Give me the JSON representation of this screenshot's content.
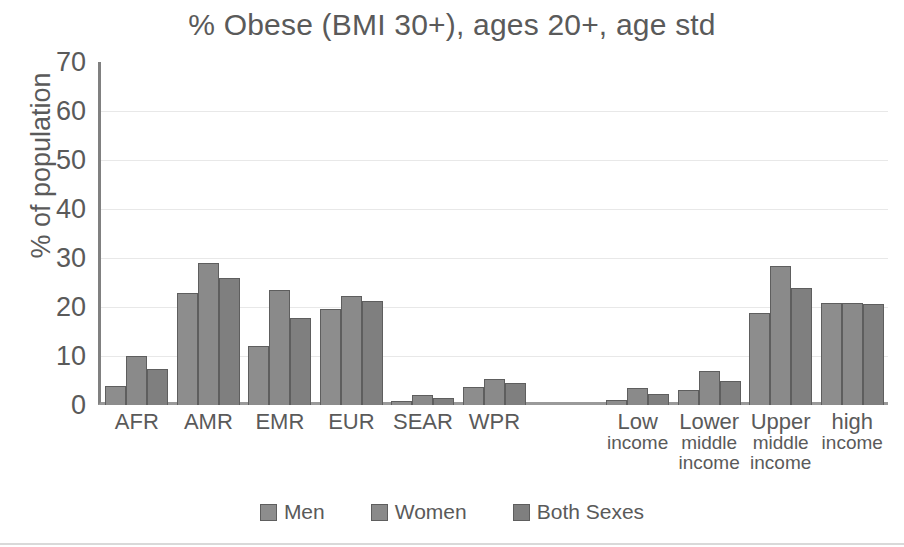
{
  "chart_data": {
    "type": "bar",
    "title": "% Obese (BMI 30+), ages 20+, age std",
    "xlabel": "",
    "ylabel": "% of population",
    "ylim": [
      0,
      70
    ],
    "ytick_step": 10,
    "yticks": [
      70,
      60,
      50,
      40,
      30,
      20,
      10,
      0
    ],
    "grid": true,
    "legend_position": "bottom",
    "categories": [
      "AFR",
      "AMR",
      "EMR",
      "EUR",
      "SEAR",
      "WPR",
      "",
      "Low income",
      "Lower middle income",
      "Upper middle income",
      "high income"
    ],
    "category_lines": [
      [
        "AFR"
      ],
      [
        "AMR"
      ],
      [
        "EMR"
      ],
      [
        "EUR"
      ],
      [
        "SEAR"
      ],
      [
        "WPR"
      ],
      [
        ""
      ],
      [
        "Low",
        "income"
      ],
      [
        "Lower",
        "middle",
        "income"
      ],
      [
        "Upper",
        "middle",
        "income"
      ],
      [
        "high",
        "income"
      ]
    ],
    "series": [
      {
        "name": "Men",
        "color": "#8d8d8d",
        "values": [
          3.9,
          22.9,
          12.1,
          19.6,
          0.9,
          3.7,
          null,
          1.1,
          3.1,
          18.8,
          20.8
        ]
      },
      {
        "name": "Women",
        "color": "#8a8a8a",
        "values": [
          10.1,
          28.9,
          23.5,
          22.2,
          2.1,
          5.4,
          null,
          3.4,
          6.9,
          28.3,
          20.8
        ]
      },
      {
        "name": "Both Sexes",
        "color": "#7f7f7f",
        "values": [
          7.3,
          25.9,
          17.8,
          21.2,
          1.5,
          4.4,
          null,
          2.3,
          5.0,
          23.8,
          20.7
        ]
      }
    ]
  }
}
